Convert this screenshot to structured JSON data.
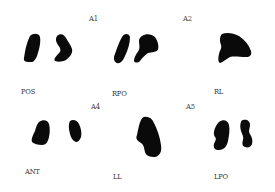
{
  "figure": {
    "panel_labels": {
      "A1": "A1",
      "A2": "A2",
      "A4": "A4",
      "A5": "A5"
    },
    "views": [
      {
        "id": "pos",
        "label": "POS"
      },
      {
        "id": "rpo",
        "label": "RPO"
      },
      {
        "id": "rl",
        "label": "RL"
      },
      {
        "id": "ant",
        "label": "ANT"
      },
      {
        "id": "ll",
        "label": "LL"
      },
      {
        "id": "lpo",
        "label": "LPO"
      }
    ],
    "colors": {
      "background": "#ffffff",
      "blob": "#0a0a0a",
      "text": "#3a3a3a"
    }
  }
}
